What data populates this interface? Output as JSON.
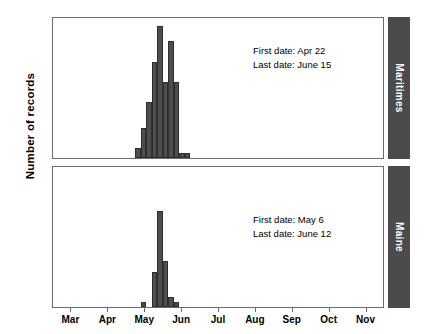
{
  "figure": {
    "ylabel": "Number of records",
    "bar_color": "#4d4d4d",
    "strip_color": "#4b4b4b",
    "frame_color": "#6b6b6b"
  },
  "axes": {
    "y_ticks": [
      5,
      10,
      15,
      20,
      25
    ],
    "y_min": 0,
    "y_max": 28,
    "x_ticks": [
      "Mar",
      "Apr",
      "May",
      "Jun",
      "Jul",
      "Aug",
      "Sep",
      "Oct",
      "Nov"
    ],
    "x_min": 0,
    "x_max": 9
  },
  "panels": [
    {
      "strip_label": "Maritimes",
      "first_date_line": "First date: Apr 22",
      "last_date_line": "Last date: June 15"
    },
    {
      "strip_label": "Maine",
      "first_date_line": "First date: May 6",
      "last_date_line": "Last date: June 12"
    }
  ],
  "chart_data": {
    "type": "bar",
    "title": "",
    "xlabel": "",
    "ylabel": "Number of records",
    "ylim": [
      0,
      28
    ],
    "xlim": [
      0,
      9
    ],
    "grid": false,
    "legend": null,
    "x_tick_labels": [
      "Mar",
      "Apr",
      "May",
      "Jun",
      "Jul",
      "Aug",
      "Sep",
      "Oct",
      "Nov"
    ],
    "y_tick_labels": [
      "5",
      "10",
      "15",
      "20",
      "25"
    ],
    "panels": [
      {
        "name": "Maritimes",
        "annotations": [
          "First date: Apr 22",
          "Last date: June 15"
        ],
        "bins": [
          {
            "x": 2.3,
            "value": 2
          },
          {
            "x": 2.45,
            "value": 6
          },
          {
            "x": 2.6,
            "value": 11
          },
          {
            "x": 2.75,
            "value": 19
          },
          {
            "x": 2.9,
            "value": 26
          },
          {
            "x": 3.05,
            "value": 15
          },
          {
            "x": 3.2,
            "value": 23
          },
          {
            "x": 3.35,
            "value": 15
          },
          {
            "x": 3.5,
            "value": 1
          },
          {
            "x": 3.65,
            "value": 1
          }
        ],
        "values": [
          2,
          6,
          11,
          19,
          26,
          15,
          23,
          15,
          1,
          1
        ]
      },
      {
        "name": "Maine",
        "annotations": [
          "First date: May 6",
          "Last date: June 12"
        ],
        "bins": [
          {
            "x": 2.45,
            "value": 1
          },
          {
            "x": 2.75,
            "value": 7
          },
          {
            "x": 2.9,
            "value": 19
          },
          {
            "x": 3.05,
            "value": 9
          },
          {
            "x": 3.2,
            "value": 2
          },
          {
            "x": 3.35,
            "value": 1
          }
        ],
        "values": [
          1,
          7,
          19,
          9,
          2,
          1
        ]
      }
    ]
  }
}
